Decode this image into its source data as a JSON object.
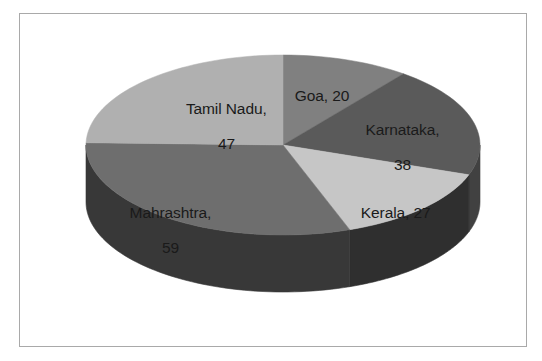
{
  "chart_data": {
    "type": "pie",
    "title": "",
    "subtitle": "",
    "xlabel": "",
    "ylabel": "",
    "legend_position": "none",
    "grid": false,
    "style": "3d-pie",
    "total": 191,
    "start_angle_deg": 0,
    "direction": "clockwise",
    "categories": [
      "Goa",
      "Karnataka",
      "Kerala",
      "Mahrashtra",
      "Tamil Nadu"
    ],
    "values": [
      20,
      38,
      27,
      59,
      47
    ],
    "slices": [
      {
        "name": "Goa",
        "value": 20,
        "label": "Goa, 20",
        "label_lines": [
          "Goa, 20"
        ],
        "percent": "10.5%",
        "angle_deg": 37.7,
        "color": "#808080",
        "side_color": "#5e5e5e"
      },
      {
        "name": "Karnataka",
        "value": 38,
        "label": "Karnataka, 38",
        "label_lines": [
          "Karnataka,",
          "38"
        ],
        "percent": "19.9%",
        "angle_deg": 71.6,
        "color": "#5a5a5a",
        "side_color": "#414141"
      },
      {
        "name": "Kerala",
        "value": 27,
        "label": "Kerala, 27",
        "label_lines": [
          "Kerala, 27"
        ],
        "percent": "14.1%",
        "angle_deg": 50.9,
        "color": "#c6c6c6",
        "side_color": "#2f2f2f"
      },
      {
        "name": "Mahrashtra",
        "value": 59,
        "label": "Mahrashtra, 59",
        "label_lines": [
          "Mahrashtra,",
          "59"
        ],
        "percent": "30.9%",
        "angle_deg": 111.2,
        "color": "#6e6e6e",
        "side_color": "#383838"
      },
      {
        "name": "Tamil Nadu",
        "value": 47,
        "label": "Tamil Nadu, 47",
        "label_lines": [
          "Tamil Nadu,",
          "47"
        ],
        "percent": "24.6%",
        "angle_deg": 88.6,
        "color": "#b0b0b0",
        "side_color": "#6b6b6b"
      }
    ],
    "colors": {
      "background": "#ffffff",
      "frame_border": "#a9a9a9",
      "label_text": "#1a1a1a"
    }
  },
  "labels": {
    "goa": "Goa, 20",
    "karnataka_line1": "Karnataka,",
    "karnataka_line2": "38",
    "kerala": "Kerala, 27",
    "mahrashtra_line1": "Mahrashtra,",
    "mahrashtra_line2": "59",
    "tamil_nadu_line1": "Tamil Nadu,",
    "tamil_nadu_line2": "47"
  }
}
